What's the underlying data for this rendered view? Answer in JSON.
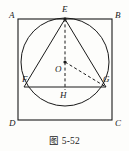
{
  "figure": {
    "caption": "图 5-52",
    "shapes": {
      "square_name": "ABCD",
      "circle_name": "O",
      "triangle_name": "EFG"
    },
    "vertex_labels": {
      "A": "A",
      "B": "B",
      "C": "C",
      "D": "D",
      "E": "E",
      "F": "F",
      "G": "G",
      "H": "H",
      "O": "O"
    },
    "colors": {
      "stroke": "#1a1a1a",
      "background": "#fdfdfb"
    },
    "geometry": {
      "square": {
        "left": 18,
        "top": 19,
        "right": 112,
        "bottom": 120
      },
      "circle": {
        "cx": 65,
        "cy": 62,
        "r": 44
      },
      "points": {
        "E": [
          65,
          19
        ],
        "F": [
          24,
          87
        ],
        "G": [
          106,
          87
        ],
        "H": [
          65,
          88
        ],
        "O": [
          65,
          62
        ]
      },
      "solid_segments": [
        "EF",
        "EG",
        "FG"
      ],
      "dashed_segments": [
        "EH",
        "OG"
      ]
    }
  }
}
